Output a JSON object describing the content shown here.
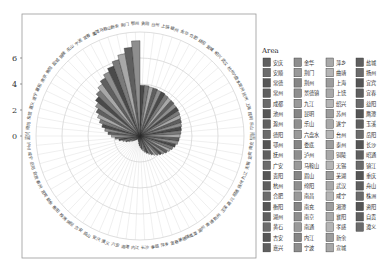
{
  "top_caption": "",
  "chart_data": {
    "type": "bar",
    "polar": true,
    "title": "",
    "xlabel": "",
    "ylabel": "",
    "yticks": [
      0,
      2,
      4,
      6
    ],
    "ylim": [
      -3.4,
      7.6
    ],
    "grid": true,
    "legend_title": "Area",
    "legend_position": "right",
    "categories_clockwise_from_top": [
      "贵阳",
      "台州",
      "上饶",
      "赣州",
      "金华",
      "合肥",
      "益阳",
      "宜城",
      "绍兴",
      "武汉",
      "杭州",
      "六盘水",
      "常州",
      "抚州",
      "上海",
      "昆明",
      "乐山",
      "南昌",
      "南充",
      "宜宾",
      "无锡",
      "九江",
      "扬州",
      "昭通",
      "嘉兴",
      "玉溪",
      "荆州",
      "南通",
      "湖州",
      "鹰潭",
      "景德镇",
      "宜春",
      "萍乡",
      "孝感",
      "长沙",
      "内江",
      "湘潭",
      "六安",
      "遵义",
      "安庆",
      "眉山",
      "吉安",
      "绵阳",
      "株洲",
      "衡阳",
      "新余",
      "宜宾2",
      "泰州",
      "自贡",
      "岳阳",
      "咸宁",
      "泸州",
      "嘉兴2",
      "德阳",
      "东营",
      "遵义2",
      "遂宁",
      "襄阳",
      "南京",
      "衡阳2",
      "盐城",
      "铜陵",
      "乐山2",
      "宁波",
      "宜春2",
      "鹰潭2",
      "马鞍山",
      "新余2",
      "荆门",
      "鄂州"
    ],
    "values_clockwise_from_top": [
      2.3,
      2.3,
      2.2,
      2.2,
      2.1,
      2.1,
      2.0,
      1.9,
      1.9,
      1.8,
      1.8,
      1.7,
      1.6,
      1.5,
      1.4,
      1.3,
      1.2,
      1.1,
      1.0,
      0.9,
      0.7,
      0.5,
      0.3,
      0.1,
      -0.1,
      -0.3,
      -0.5,
      -0.7,
      -0.9,
      -1.1,
      -1.3,
      -1.5,
      -1.7,
      -1.9,
      -2.1,
      -2.3,
      -2.5,
      -2.7,
      -2.8,
      -2.9,
      -3.0,
      -3.0,
      -2.9,
      -2.8,
      -2.7,
      -2.5,
      -2.3,
      -2.0,
      -1.7,
      -1.4,
      -1.0,
      -0.6,
      -0.2,
      0.2,
      0.6,
      1.0,
      1.4,
      1.8,
      2.2,
      2.6,
      3.0,
      3.4,
      3.8,
      4.2,
      4.6,
      5.0,
      5.5,
      6.0,
      6.6,
      7.3
    ],
    "legend_entries": [
      [
        "安庆",
        "安顺",
        "常德",
        "常州",
        "成都",
        "池州",
        "滁州",
        "德阳",
        "鄂州",
        "抚州",
        "广安",
        "贵阳",
        "杭州",
        "合肥",
        "衡阳",
        "湖州",
        "黄石",
        "吉安",
        "嘉兴"
      ],
      [
        "金华",
        "荆门",
        "荆州",
        "景德镇",
        "九江",
        "昆明",
        "乐山",
        "六盘水",
        "娄底",
        "泸州",
        "马鞍山",
        "眉山",
        "绵阳",
        "南昌",
        "南充",
        "南京",
        "南通",
        "内江",
        "宁波"
      ],
      [
        "萍乡",
        "曲靖",
        "上海",
        "上饶",
        "绍兴",
        "苏州",
        "遂宁",
        "台州",
        "泰州",
        "铜陵",
        "无锡",
        "芜湖",
        "武汉",
        "咸宁",
        "湘潭",
        "襄阳",
        "孝感",
        "新余",
        "宣城"
      ],
      [
        "盐城",
        "扬州",
        "宜宾",
        "宜春",
        "益阳",
        "鹰潭",
        "玉溪",
        "岳阳",
        "长沙",
        "昭通",
        "镇江",
        "重庆",
        "舟山",
        "株洲",
        "资阳",
        "自贡",
        "遵义"
      ]
    ]
  },
  "colors": {
    "bar_dark": "#4a4a4a",
    "bar_mid": "#7a7a7a",
    "bar_light": "#a8a8a8",
    "grid": "#c8c8c8",
    "frame": "#9a9a9a"
  }
}
